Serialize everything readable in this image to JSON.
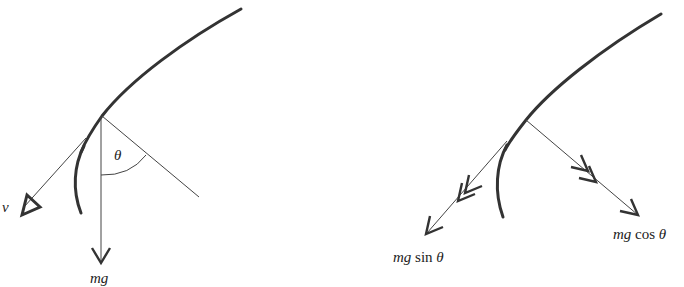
{
  "figures": [
    {
      "id": "left",
      "description": "Particle on curved path with velocity and weight",
      "labels": {
        "velocity": "v",
        "weight": "mg",
        "angle": "θ"
      }
    },
    {
      "id": "right",
      "description": "Weight resolved into tangential and normal components",
      "labels": {
        "tangential_prefix": "mg",
        "tangential_fn": "sin",
        "tangential_angle": "θ",
        "normal_prefix": "mg",
        "normal_fn": "cos",
        "normal_angle": "θ"
      }
    }
  ],
  "colors": {
    "stroke": "#333333",
    "thin": "#444444",
    "background": "#ffffff"
  }
}
